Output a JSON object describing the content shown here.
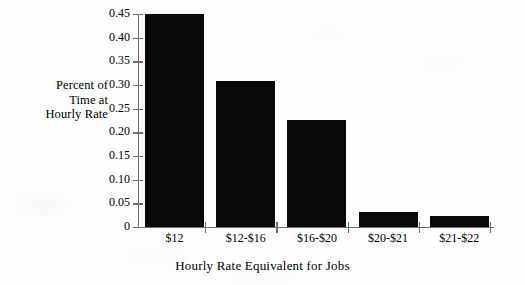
{
  "chart_data": {
    "type": "bar",
    "title": "",
    "xlabel": "Hourly Rate Equivalent for Jobs",
    "ylabel": "Percent of Time at Hourly Rate",
    "ylabel_lines": [
      "Percent of",
      "Time at",
      "Hourly Rate"
    ],
    "categories": [
      "$12",
      "$12-$16",
      "$16-$20",
      "$20-$21",
      "$21-$22"
    ],
    "values": [
      0.451,
      0.308,
      0.226,
      0.031,
      0.024
    ],
    "ylim": [
      0,
      0.45
    ],
    "ytick_values": [
      0,
      0.05,
      0.1,
      0.15,
      0.2,
      0.25,
      0.3,
      0.35,
      0.4,
      0.45
    ],
    "ytick_labels": [
      "0",
      "0.05",
      "0.10",
      "0.15",
      "0.20",
      "0.25",
      "0.30",
      "0.35",
      "0.40",
      "0.45"
    ],
    "grid": false,
    "legend": null,
    "bar_color": "#080808",
    "axis_color": "#6f6f6f",
    "background_color": "#ffffff"
  }
}
